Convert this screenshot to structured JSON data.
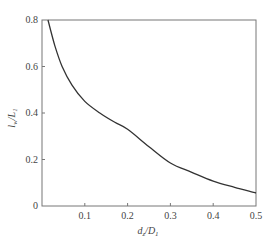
{
  "chart_data": {
    "type": "line",
    "title": "",
    "xlabel": "d_z/D_1",
    "ylabel": "l_w/L_1",
    "xlim": [
      0,
      0.5
    ],
    "ylim": [
      0,
      0.8
    ],
    "grid": false,
    "legend": null,
    "x_ticks": [
      "0.1",
      "0.2",
      "0.3",
      "0.4",
      "0.5"
    ],
    "y_ticks": [
      "0",
      "0.2",
      "0.4",
      "0.6",
      "0.8"
    ],
    "series": [
      {
        "name": "curve",
        "x": [
          0.014,
          0.03,
          0.047,
          0.07,
          0.1,
          0.135,
          0.17,
          0.2,
          0.25,
          0.3,
          0.35,
          0.4,
          0.45,
          0.5
        ],
        "values": [
          0.8,
          0.69,
          0.6,
          0.52,
          0.45,
          0.4,
          0.36,
          0.33,
          0.255,
          0.185,
          0.145,
          0.107,
          0.08,
          0.056
        ]
      }
    ],
    "color": "#333333"
  },
  "labels": {
    "x_axis": "d",
    "x_axis_sub": "z",
    "x_axis_den": "/D",
    "x_axis_den_sub": "1",
    "y_axis": "l",
    "y_axis_sub": "w",
    "y_axis_den": "/L",
    "y_axis_den_sub": "1",
    "y_zero": "0",
    "y_02": "0.2",
    "y_04": "0.4",
    "y_06": "0.6",
    "y_08": "0.8",
    "x_01": "0.1",
    "x_02": "0.2",
    "x_03": "0.3",
    "x_04": "0.4",
    "x_05": "0.5"
  }
}
